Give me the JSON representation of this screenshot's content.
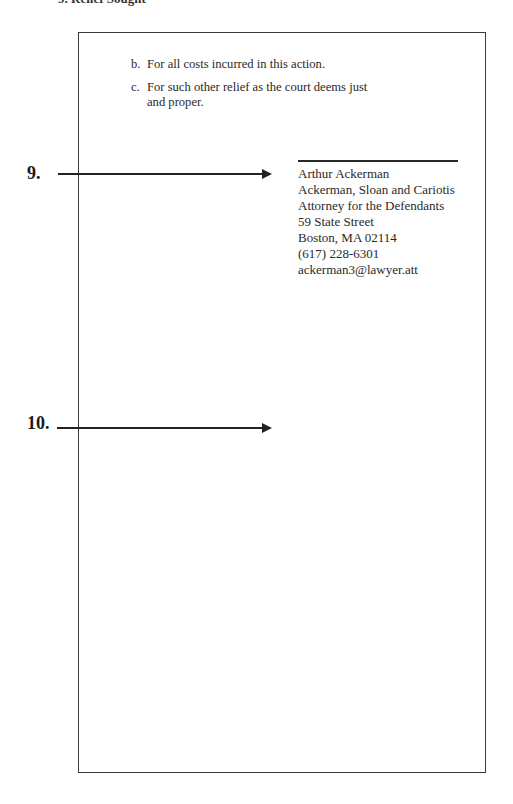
{
  "header_fragment": "9. Relief Sought",
  "relief_items": [
    {
      "marker": "b.",
      "text": "For all costs incurred in this action."
    },
    {
      "marker": "c.",
      "text": "For such other relief as the court deems just and proper."
    }
  ],
  "callouts": [
    {
      "number": "9."
    },
    {
      "number": "10."
    }
  ],
  "signature_block": {
    "name": "Arthur Ackerman",
    "firm": "Ackerman, Sloan and Cariotis",
    "role": "Attorney for the Defendants",
    "street": "59 State Street",
    "city_state_zip": "Boston, MA 02114",
    "phone": "(617) 228-6301",
    "email": "ackerman3@lawyer.att"
  },
  "colors": {
    "ink": "#2a2a2a",
    "border": "#3a3a3a",
    "background": "#ffffff"
  }
}
